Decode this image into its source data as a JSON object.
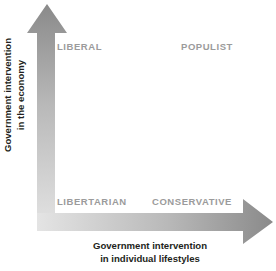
{
  "diagram": {
    "background_color": "#ffffff",
    "quadrants": [
      {
        "key": "liberal",
        "label": "LIBERAL",
        "position": "top-left"
      },
      {
        "key": "populist",
        "label": "POPULIST",
        "position": "top-right"
      },
      {
        "key": "libertarian",
        "label": "LIBERTARIAN",
        "position": "bottom-left"
      },
      {
        "key": "conservative",
        "label": "CONSERVATIVE",
        "position": "bottom-right"
      }
    ],
    "quadrant_label_color": "#9b9b9b",
    "axes": {
      "y": {
        "name": "vertical-axis",
        "direction": "up",
        "line1": "Government intervention",
        "line2": "in the economy",
        "gradient_from": "#8a8a8a",
        "gradient_to": "#e2e2e2",
        "label_color": "#231f20"
      },
      "x": {
        "name": "horizontal-axis",
        "direction": "right",
        "line1": "Government intervention",
        "line2": "in individual lifestyles",
        "gradient_from": "#e2e2e2",
        "gradient_to": "#8a8a8a",
        "label_color": "#231f20"
      }
    }
  }
}
